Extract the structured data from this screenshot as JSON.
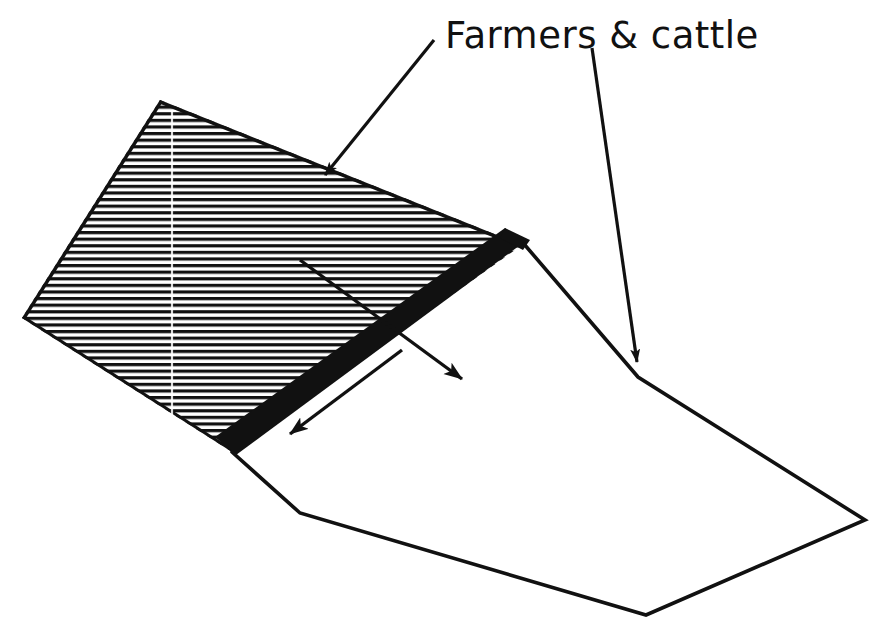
{
  "figure": {
    "background_color": "#ffffff",
    "ink_color": "#111111",
    "annotations": [
      {
        "id": "farmers-cattle",
        "text": "Farmers & cattle",
        "x": 445,
        "y": 48,
        "font_size": 37,
        "leader_lines": 2
      }
    ],
    "shapes": {
      "hatched_block": {
        "name": "hatched-upland-surface",
        "fill": "horizontal-hatch",
        "hatch_spacing_px": 6.6,
        "hatch_line_width_px": 3.2,
        "outline_color": "#111111",
        "points": "160,100 522,245 232,452 22,318"
      },
      "scarp_band": {
        "name": "thick-black-escarpment-band",
        "fill": "#111111",
        "points": "522,245 232,452 215,437 505,231"
      },
      "lowland_plain": {
        "name": "lowland-plain-outline",
        "fill": "none",
        "stroke_width_px": 3.5,
        "points": "522,245 638,375 865,520 646,615 300,513 232,452"
      }
    },
    "leader_lines": [
      {
        "name": "leader-to-upland",
        "from": [
          434,
          40
        ],
        "to": [
          318,
          182
        ],
        "arrowhead": "filled-triangle"
      },
      {
        "name": "leader-to-lowland",
        "from": [
          592,
          48
        ],
        "to": [
          638,
          375
        ],
        "arrowhead": "filled-triangle"
      }
    ],
    "movement_arrows": [
      {
        "name": "arrow-downslope-right",
        "from": [
          300,
          260
        ],
        "to": [
          472,
          388
        ],
        "arrowhead": "filled-triangle"
      },
      {
        "name": "arrow-downslope-left",
        "from": [
          400,
          352
        ],
        "to": [
          278,
          442
        ],
        "arrowhead": "filled-triangle"
      }
    ]
  }
}
